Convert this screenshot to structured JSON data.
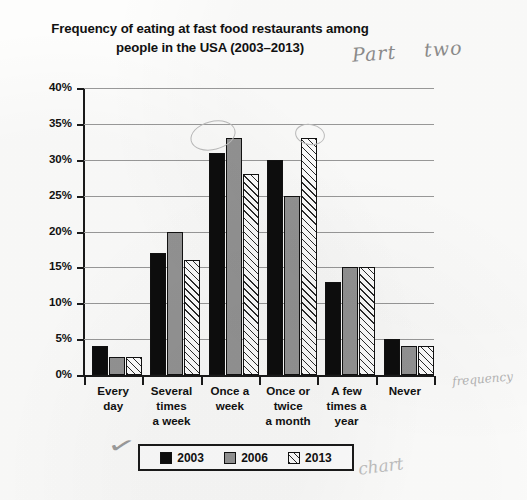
{
  "chart_data": {
    "type": "bar",
    "title": "Frequency of eating at fast food restaurants among people in the USA (2003–2013)",
    "title_line1": "Frequency of eating at fast food restaurants among",
    "title_line2": "people in the USA (2003–2013)",
    "xlabel": "",
    "ylabel": "% of people",
    "ylim": [
      0,
      40
    ],
    "ytick_step": 5,
    "ytick_labels": [
      "40%",
      "35%",
      "30%",
      "25%",
      "20%",
      "15%",
      "10%",
      "5%",
      "0%"
    ],
    "ytick_values": [
      40,
      35,
      30,
      25,
      20,
      15,
      10,
      5,
      0
    ],
    "grid": true,
    "legend_position": "bottom",
    "categories": [
      "Every day",
      "Several times a week",
      "Once a week",
      "Once or twice a month",
      "A few times a year",
      "Never"
    ],
    "category_lines": [
      [
        "Every",
        "day"
      ],
      [
        "Several",
        "times",
        "a week"
      ],
      [
        "Once a",
        "week"
      ],
      [
        "Once or",
        "twice",
        "a month"
      ],
      [
        "A few",
        "times a",
        "year"
      ],
      [
        "Never"
      ]
    ],
    "series": [
      {
        "name": "2003",
        "color": "#0d0d0d",
        "pattern": "solid",
        "values": [
          4,
          17,
          31,
          30,
          13,
          5
        ]
      },
      {
        "name": "2006",
        "color": "#949494",
        "pattern": "solid",
        "values": [
          2.5,
          20,
          33,
          25,
          15,
          4
        ]
      },
      {
        "name": "2013",
        "color": "#ffffff",
        "pattern": "diagonal-hatch",
        "values": [
          2.5,
          16,
          28,
          33,
          15,
          4
        ]
      }
    ]
  },
  "legend": {
    "items": [
      {
        "label": "2003"
      },
      {
        "label": "2006"
      },
      {
        "label": "2013"
      }
    ]
  },
  "annotations": {
    "top_right": "Part",
    "top_right_second": "two",
    "near_never": "frequency",
    "bottom_right": "chart",
    "check_mark": "✓"
  }
}
